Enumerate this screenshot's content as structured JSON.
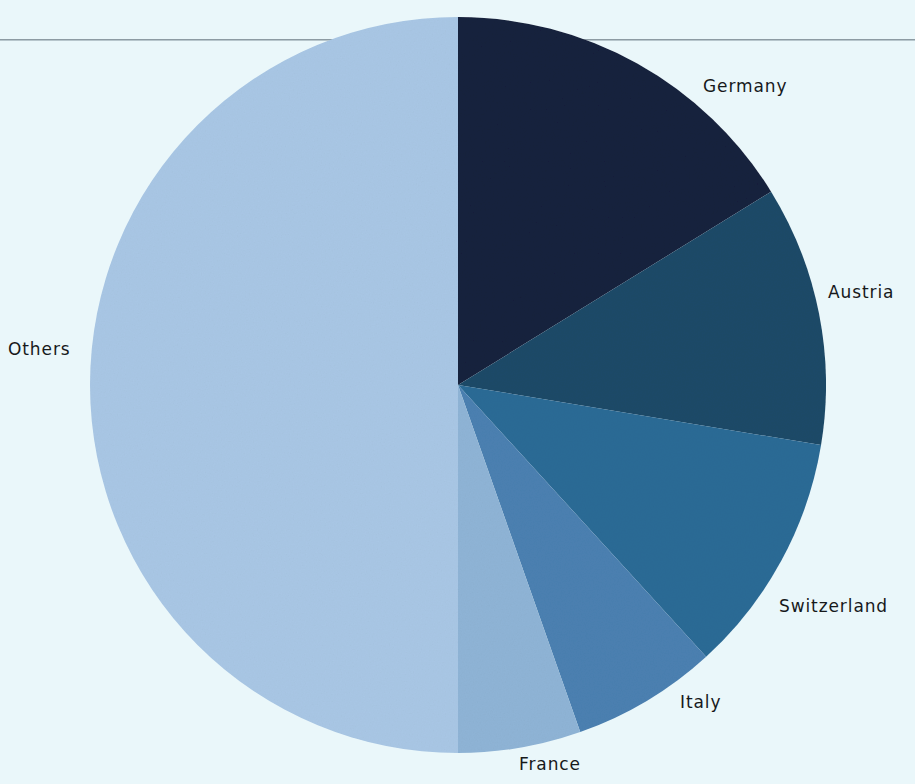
{
  "page": {
    "background_color": "#eaf7fa",
    "title_faint": "",
    "rule_color": "#8d9ba3"
  },
  "chart_data": {
    "type": "pie",
    "title": "",
    "xlabel": "",
    "ylabel": "",
    "legend_position": "none",
    "labels_position": "outside",
    "grid": false,
    "start_angle_deg": 0,
    "direction": "clockwise",
    "center": {
      "x": 458,
      "y": 385
    },
    "radius": 368,
    "categories": [
      "Germany",
      "Austria",
      "Switzerland",
      "Italy",
      "France",
      "Others"
    ],
    "values": [
      16.2,
      11.4,
      10.6,
      6.4,
      5.4,
      50.0
    ],
    "units": "percent",
    "slices": [
      {
        "label": "Germany",
        "value": 16.2,
        "start_deg": 0.0,
        "end_deg": 58.3,
        "color": "#16203d"
      },
      {
        "label": "Austria",
        "value": 11.4,
        "start_deg": 58.3,
        "end_deg": 99.4,
        "color": "#1c4a68"
      },
      {
        "label": "Switzerland",
        "value": 10.6,
        "start_deg": 99.4,
        "end_deg": 137.6,
        "color": "#2b6b96"
      },
      {
        "label": "Italy",
        "value": 6.4,
        "start_deg": 137.6,
        "end_deg": 160.6,
        "color": "#4b80b1"
      },
      {
        "label": "France",
        "value": 5.4,
        "start_deg": 160.6,
        "end_deg": 180.0,
        "color": "#8fb4d6"
      },
      {
        "label": "Others",
        "value": 50.0,
        "start_deg": 180.0,
        "end_deg": 360.0,
        "color": "#a9c7e5"
      }
    ]
  },
  "labels": {
    "germany": "Germany",
    "austria": "Austria",
    "switzerland": "Switzerland",
    "italy": "Italy",
    "france": "France",
    "others": "Others"
  }
}
